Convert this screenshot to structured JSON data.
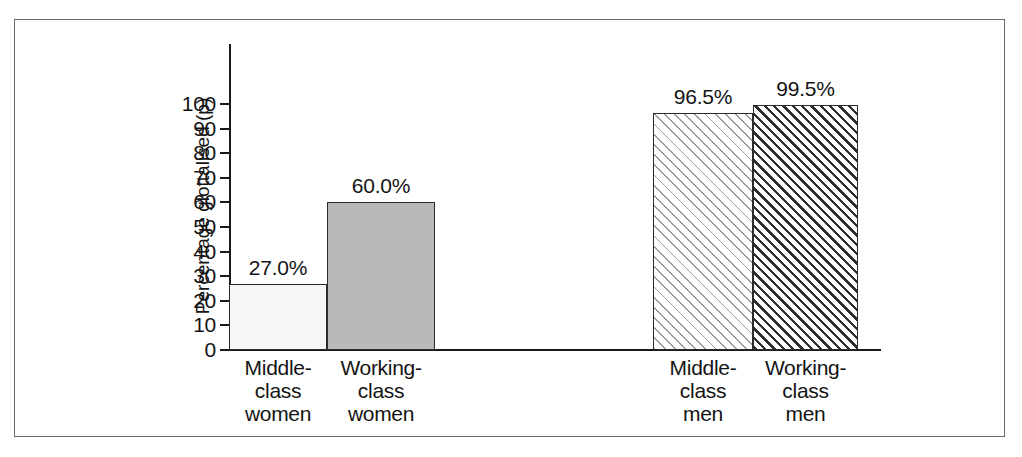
{
  "chart_data": {
    "type": "bar",
    "title": "",
    "xlabel": "",
    "ylabel": "Percentage glottalised (p)",
    "categories": [
      "Middle-\nclass\nwomen",
      "Working-\nclass\nwomen",
      "Middle-\nclass\nmen",
      "Working-\nclass\nmen"
    ],
    "values": [
      27.0,
      60.0,
      96.5,
      99.5
    ],
    "value_labels": [
      "27.0%",
      "60.0%",
      "96.5%",
      "99.5%"
    ],
    "ylim": [
      0,
      100
    ],
    "yticks": [
      0,
      10,
      20,
      30,
      40,
      50,
      60,
      70,
      80,
      90,
      100
    ],
    "ytick_labels": [
      "0",
      "10",
      "20",
      "30",
      "40",
      "50",
      "60",
      "70",
      "80",
      "90",
      "100"
    ],
    "grid": false,
    "legend": "none",
    "bar_fills": [
      "solid-light-gray",
      "solid-medium-gray",
      "hatch-light-diagonal",
      "hatch-dark-diagonal"
    ],
    "group_gap_after_index": 1,
    "colors": {
      "bar1": "#f6f6f6",
      "bar2": "#b9b9b9",
      "hatch_light": "#9a9a9a",
      "hatch_dark": "#2e2e2e",
      "axis": "#1a1a1a",
      "frame": "#6a6a6a",
      "text": "#141414",
      "background": "#ffffff"
    }
  }
}
